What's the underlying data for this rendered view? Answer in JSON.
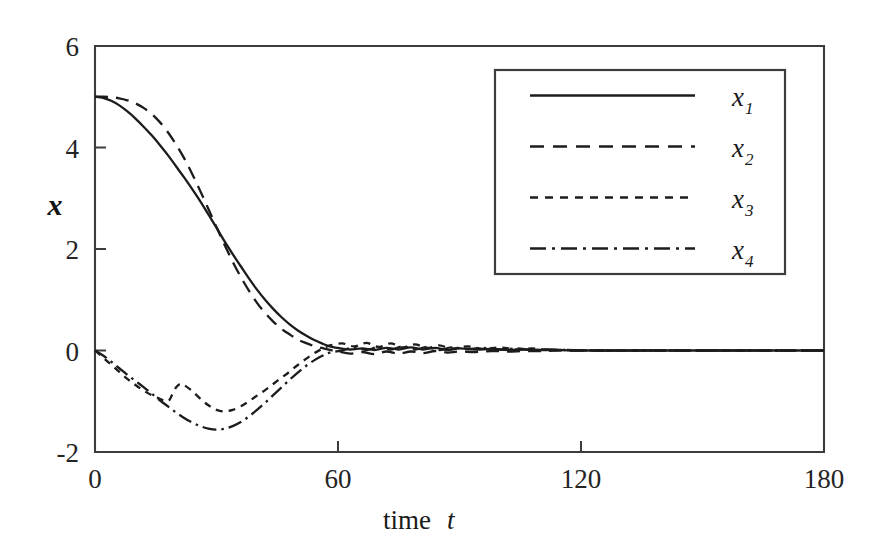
{
  "chart_data": {
    "type": "line",
    "title": "",
    "xlabel": "time  t",
    "xlabel_main": "time",
    "xlabel_var": "t",
    "ylabel": "x",
    "xlim": [
      0,
      180
    ],
    "ylim": [
      -2,
      6
    ],
    "xticks": [
      0,
      60,
      120,
      180
    ],
    "yticks": [
      6,
      4,
      2,
      0,
      -2
    ],
    "xtick_labels": [
      "0",
      "60",
      "120",
      "180"
    ],
    "ytick_labels": [
      "6",
      "4",
      "2",
      "0",
      "-2"
    ],
    "grid": false,
    "legend_position": "upper-right-inset",
    "legend_entries": [
      {
        "label": "x",
        "subscript": "1",
        "style": "solid"
      },
      {
        "label": "x",
        "subscript": "2",
        "style": "long-dash"
      },
      {
        "label": "x",
        "subscript": "3",
        "style": "short-dash"
      },
      {
        "label": "x",
        "subscript": "4",
        "style": "dash-dot"
      }
    ],
    "line_color": "#1c1c1c",
    "axis_color": "#3c3c3c",
    "background": "#ffffff",
    "series": [
      {
        "name": "x1",
        "style": "solid",
        "x": [
          0,
          2,
          4,
          6,
          8,
          10,
          12,
          14,
          16,
          18,
          20,
          22,
          24,
          26,
          28,
          30,
          32,
          34,
          36,
          38,
          40,
          42,
          44,
          46,
          48,
          50,
          52,
          54,
          56,
          58,
          60,
          63,
          66,
          69,
          72,
          75,
          78,
          81,
          84,
          87,
          90,
          94,
          98,
          102,
          106,
          110,
          114,
          118,
          125,
          140,
          160,
          180
        ],
        "values": [
          5.0,
          4.98,
          4.92,
          4.83,
          4.71,
          4.57,
          4.41,
          4.24,
          4.05,
          3.85,
          3.63,
          3.41,
          3.18,
          2.94,
          2.68,
          2.42,
          2.15,
          1.9,
          1.66,
          1.42,
          1.2,
          1.0,
          0.82,
          0.66,
          0.52,
          0.4,
          0.3,
          0.21,
          0.14,
          0.08,
          0.05,
          0.02,
          0.04,
          0.01,
          0.05,
          0.02,
          0.06,
          0.02,
          0.05,
          0.01,
          0.04,
          0.02,
          0.03,
          0.01,
          0.02,
          0.01,
          0.01,
          0.0,
          0.0,
          0.0,
          0.0,
          0.0
        ]
      },
      {
        "name": "x2",
        "style": "long-dash",
        "x": [
          0,
          2,
          4,
          6,
          8,
          10,
          12,
          14,
          16,
          18,
          20,
          22,
          24,
          26,
          28,
          30,
          32,
          34,
          36,
          38,
          40,
          42,
          44,
          46,
          48,
          50,
          52,
          54,
          56,
          58,
          60,
          63,
          66,
          69,
          72,
          75,
          78,
          81,
          84,
          87,
          90,
          94,
          98,
          102,
          106,
          110,
          114,
          118,
          125,
          140,
          160,
          180
        ],
        "values": [
          5.0,
          5.0,
          4.99,
          4.97,
          4.93,
          4.87,
          4.78,
          4.66,
          4.5,
          4.3,
          4.06,
          3.79,
          3.48,
          3.14,
          2.79,
          2.43,
          2.08,
          1.75,
          1.45,
          1.18,
          0.94,
          0.74,
          0.57,
          0.43,
          0.32,
          0.22,
          0.15,
          0.09,
          0.05,
          0.01,
          -0.02,
          -0.06,
          -0.03,
          -0.07,
          -0.02,
          -0.06,
          -0.02,
          -0.05,
          -0.01,
          -0.04,
          -0.02,
          -0.03,
          -0.01,
          -0.02,
          -0.01,
          -0.01,
          0.0,
          0.0,
          0.0,
          0.0,
          0.0,
          0.0
        ]
      },
      {
        "name": "x3",
        "style": "short-dash",
        "x": [
          0,
          2,
          4,
          6,
          8,
          10,
          12,
          14,
          16,
          18,
          19,
          20,
          21,
          22,
          24,
          26,
          28,
          30,
          32,
          34,
          36,
          38,
          40,
          42,
          44,
          46,
          48,
          50,
          52,
          54,
          56,
          58,
          61,
          64,
          67,
          70,
          73,
          76,
          79,
          82,
          85,
          88,
          92,
          96,
          100,
          104,
          108,
          112,
          116,
          125,
          140,
          160,
          180
        ],
        "values": [
          0.0,
          -0.14,
          -0.28,
          -0.42,
          -0.56,
          -0.68,
          -0.79,
          -0.88,
          -0.95,
          -1.0,
          -0.88,
          -0.73,
          -0.66,
          -0.68,
          -0.8,
          -0.95,
          -1.08,
          -1.17,
          -1.2,
          -1.17,
          -1.1,
          -1.0,
          -0.89,
          -0.78,
          -0.66,
          -0.54,
          -0.42,
          -0.29,
          -0.17,
          -0.06,
          0.03,
          0.1,
          0.14,
          0.08,
          0.15,
          0.07,
          0.14,
          0.06,
          0.12,
          0.05,
          0.1,
          0.04,
          0.08,
          0.03,
          0.06,
          0.02,
          0.04,
          0.01,
          0.01,
          0.0,
          0.0,
          0.0,
          0.0
        ]
      },
      {
        "name": "x4",
        "style": "dash-dot",
        "x": [
          0,
          2,
          4,
          6,
          8,
          10,
          12,
          14,
          16,
          18,
          20,
          22,
          24,
          26,
          28,
          30,
          32,
          34,
          36,
          38,
          40,
          42,
          44,
          46,
          48,
          50,
          52,
          54,
          56,
          58,
          61,
          64,
          67,
          70,
          73,
          76,
          79,
          82,
          85,
          88,
          92,
          96,
          100,
          104,
          108,
          112,
          116,
          125,
          140,
          160,
          180
        ],
        "values": [
          0.0,
          -0.1,
          -0.22,
          -0.35,
          -0.48,
          -0.6,
          -0.72,
          -0.85,
          -0.98,
          -1.1,
          -1.22,
          -1.33,
          -1.42,
          -1.49,
          -1.54,
          -1.56,
          -1.54,
          -1.49,
          -1.41,
          -1.3,
          -1.17,
          -1.03,
          -0.88,
          -0.73,
          -0.58,
          -0.44,
          -0.31,
          -0.2,
          -0.11,
          -0.04,
          0.0,
          0.06,
          0.01,
          0.07,
          0.02,
          0.08,
          0.02,
          0.07,
          0.01,
          0.06,
          0.03,
          0.05,
          0.02,
          0.04,
          0.01,
          0.02,
          0.01,
          0.0,
          0.0,
          0.0,
          0.0
        ]
      }
    ]
  },
  "plot_geometry": {
    "left": 95,
    "right": 824,
    "top": 46,
    "bottom": 452
  },
  "legend_geometry": {
    "x": 495,
    "y": 70,
    "width": 290,
    "height": 204
  }
}
